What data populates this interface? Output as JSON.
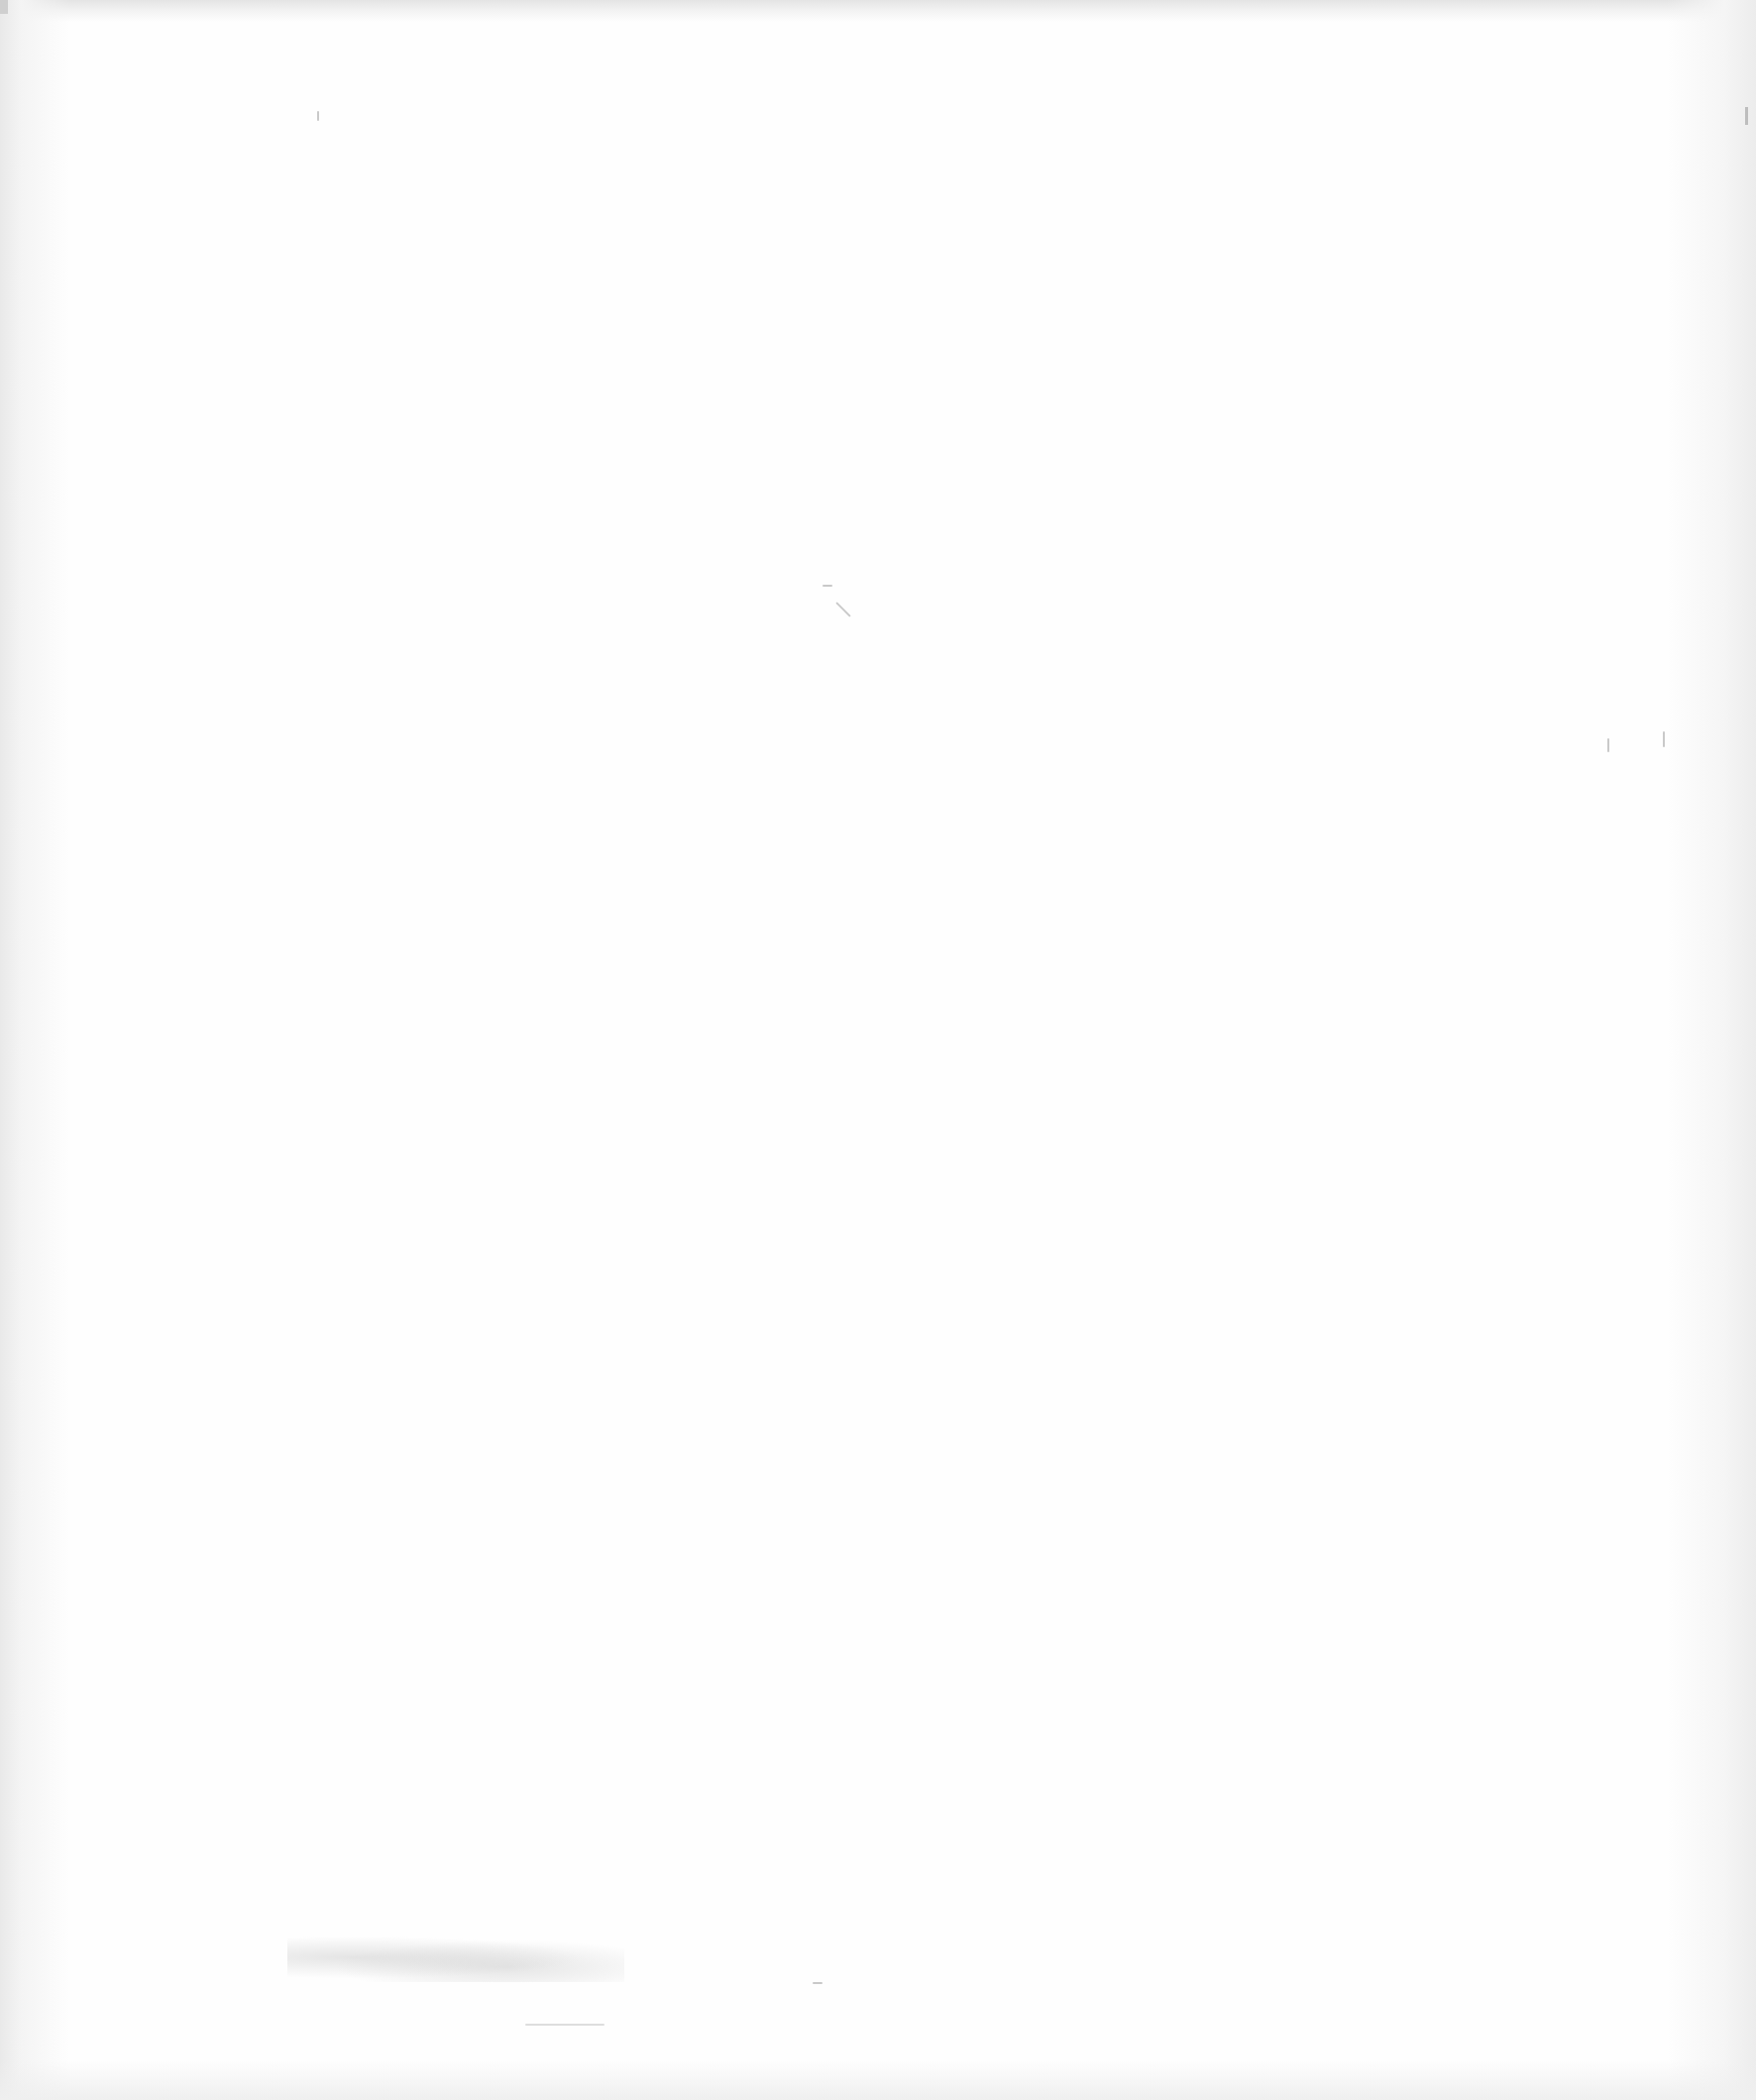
{
  "page": {
    "type": "blank-scanned-page",
    "background_color": "#fefefe",
    "edge_shade_color": "#e9e9e9",
    "text_content": []
  }
}
